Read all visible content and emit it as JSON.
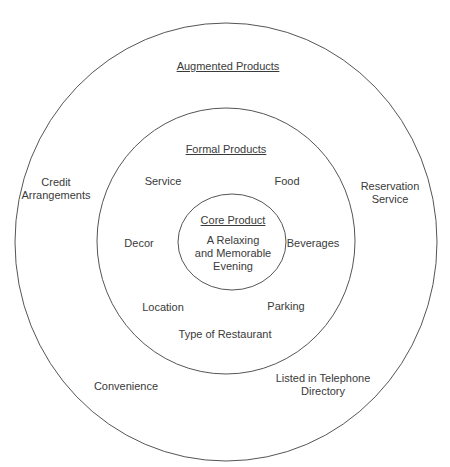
{
  "diagram": {
    "type": "concentric-circles",
    "stroke_color": "#555555",
    "rings": {
      "outer": {
        "title": "Augmented Products",
        "items": [
          "Credit Arrangements",
          "Reservation Service",
          "Convenience",
          "Listed in Telephone Directory"
        ]
      },
      "middle": {
        "title": "Formal Products",
        "items": [
          "Service",
          "Food",
          "Decor",
          "Beverages",
          "Location",
          "Parking",
          "Type of Restaurant"
        ]
      },
      "inner": {
        "title": "Core Product",
        "lines": [
          "A Relaxing",
          "and Memorable",
          "Evening"
        ]
      }
    },
    "outer_labels": {
      "title": "Augmented Products",
      "credit_1": "Credit",
      "credit_2": "Arrangements",
      "reservation_1": "Reservation",
      "reservation_2": "Service",
      "convenience": "Convenience",
      "telephone_1": "Listed in Telephone",
      "telephone_2": "Directory"
    },
    "middle_labels": {
      "title": "Formal Products",
      "service": "Service",
      "food": "Food",
      "decor": "Decor",
      "beverages": "Beverages",
      "location": "Location",
      "parking": "Parking",
      "type": "Type of Restaurant"
    },
    "inner_labels": {
      "title": "Core Product",
      "line1": "A Relaxing",
      "line2": "and Memorable",
      "line3": "Evening"
    }
  }
}
